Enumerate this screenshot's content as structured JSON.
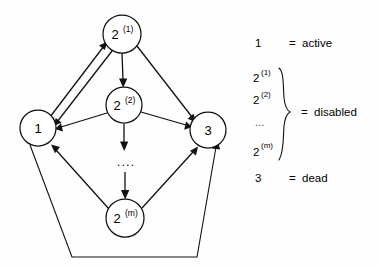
{
  "figure": {
    "background_color": "#fefefe",
    "ink_color": "#111111"
  },
  "graph": {
    "nodes": [
      {
        "id": "n1",
        "base": "1",
        "sup": "",
        "cx": 38,
        "cy": 128,
        "r": 18
      },
      {
        "id": "n21",
        "base": "2",
        "sup": "(1)",
        "cx": 122,
        "cy": 34,
        "r": 19
      },
      {
        "id": "n22",
        "base": "2",
        "sup": "(2)",
        "cx": 124,
        "cy": 105,
        "r": 18
      },
      {
        "id": "n2m",
        "base": "2",
        "sup": "(m)",
        "cx": 125,
        "cy": 218,
        "r": 19
      },
      {
        "id": "n3",
        "base": "3",
        "sup": "",
        "cx": 208,
        "cy": 130,
        "r": 18
      }
    ],
    "vertical_ellipsis": "....",
    "edges": [
      {
        "from": "n1",
        "to": "n21",
        "label": ""
      },
      {
        "from": "n21",
        "to": "n1",
        "label": ""
      },
      {
        "from": "n21",
        "to": "n22",
        "label": ""
      },
      {
        "from": "n21",
        "to": "n3",
        "label": ""
      },
      {
        "from": "n22",
        "to": "n1",
        "label": ""
      },
      {
        "from": "n22",
        "to": "n3",
        "label": ""
      },
      {
        "from": "n22",
        "to": "dots",
        "label": ""
      },
      {
        "from": "dots",
        "to": "n2m",
        "label": ""
      },
      {
        "from": "n2m",
        "to": "n1",
        "label": ""
      },
      {
        "from": "n2m",
        "to": "n3",
        "label": ""
      },
      {
        "from": "n1",
        "to": "n3",
        "label": ""
      }
    ]
  },
  "legend": {
    "rows": [
      {
        "id": "row-active",
        "keys": [
          {
            "base": "1",
            "sup": ""
          }
        ],
        "equals": "=",
        "value": "active"
      },
      {
        "id": "row-disabled",
        "keys": [
          {
            "base": "2",
            "sup": "(1)"
          },
          {
            "base": "2",
            "sup": "(2)"
          },
          {
            "base": "...",
            "sup": ""
          },
          {
            "base": "2",
            "sup": "(m)"
          }
        ],
        "equals": "=",
        "value": "disabled"
      },
      {
        "id": "row-dead",
        "keys": [
          {
            "base": "3",
            "sup": ""
          }
        ],
        "equals": "=",
        "value": "dead"
      }
    ]
  }
}
